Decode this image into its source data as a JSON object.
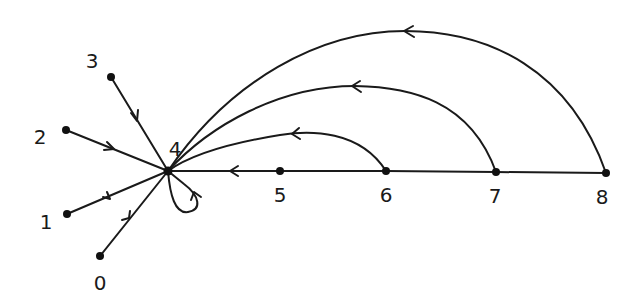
{
  "diagram": {
    "type": "directed-graph",
    "style": "hand-drawn",
    "colors": {
      "ink": "#1a1a1a",
      "background": "#ffffff"
    },
    "nodes": [
      {
        "id": "0",
        "label": "0",
        "x": 100,
        "y": 256,
        "lx": 100,
        "ly": 290
      },
      {
        "id": "1",
        "label": "1",
        "x": 67,
        "y": 214,
        "lx": 46,
        "ly": 229
      },
      {
        "id": "2",
        "label": "2",
        "x": 66,
        "y": 130,
        "lx": 40,
        "ly": 144
      },
      {
        "id": "3",
        "label": "3",
        "x": 111,
        "y": 77,
        "lx": 92,
        "ly": 68
      },
      {
        "id": "4",
        "label": "4",
        "x": 168,
        "y": 171,
        "lx": 175,
        "ly": 156
      },
      {
        "id": "5",
        "label": "5",
        "x": 280,
        "y": 171,
        "lx": 280,
        "ly": 202
      },
      {
        "id": "6",
        "label": "6",
        "x": 386,
        "y": 171,
        "lx": 386,
        "ly": 202
      },
      {
        "id": "7",
        "label": "7",
        "x": 496,
        "y": 172,
        "lx": 495,
        "ly": 203
      },
      {
        "id": "8",
        "label": "8",
        "x": 606,
        "y": 173,
        "lx": 602,
        "ly": 204
      }
    ],
    "edges": [
      {
        "from": "0",
        "to": "4",
        "kind": "straight"
      },
      {
        "from": "1",
        "to": "4",
        "kind": "straight"
      },
      {
        "from": "2",
        "to": "4",
        "kind": "straight"
      },
      {
        "from": "3",
        "to": "4",
        "kind": "straight"
      },
      {
        "from": "4",
        "to": "4",
        "kind": "self-loop"
      },
      {
        "from": "5",
        "to": "4",
        "kind": "straight"
      },
      {
        "from": "6",
        "to": "5",
        "kind": "straight"
      },
      {
        "from": "7",
        "to": "6",
        "kind": "straight"
      },
      {
        "from": "8",
        "to": "7",
        "kind": "straight"
      },
      {
        "from": "6",
        "to": "4",
        "kind": "arc"
      },
      {
        "from": "7",
        "to": "4",
        "kind": "arc"
      },
      {
        "from": "8",
        "to": "4",
        "kind": "arc"
      }
    ]
  }
}
